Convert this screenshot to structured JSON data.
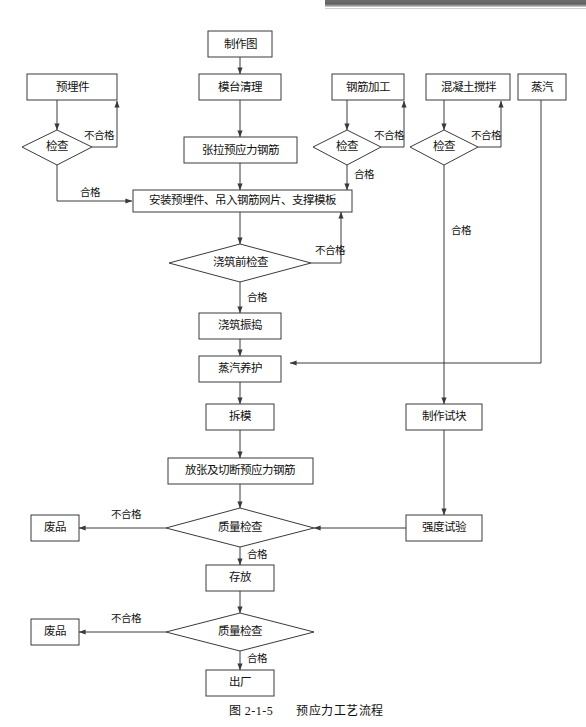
{
  "figure": {
    "caption_number": "图 2-1-5",
    "caption_title": "预应力工艺流程"
  },
  "labels": {
    "pass": "合格",
    "fail": "不合格",
    "inspect": "检查"
  },
  "nodes": {
    "drawing": "制作图",
    "platform_cleaning": "模台清理",
    "tension_prestress_bars": "张拉预应力钢筋",
    "embedded_parts": "预埋件",
    "embedded_inspect": "检查",
    "rebar_processing": "钢筋加工",
    "rebar_inspect": "检查",
    "concrete_mixing": "混凝土搅拌",
    "concrete_inspect": "检查",
    "steam": "蒸汽",
    "install_assembly": "安装预埋件、吊入钢筋网片、支撑模板",
    "pre_pour_inspect": "浇筑前检查",
    "pour_vibrate": "浇筑振捣",
    "steam_curing": "蒸汽养护",
    "demould": "拆模",
    "release_cut_bars": "放张及切断预应力钢筋",
    "make_test_block": "制作试块",
    "strength_test": "强度试验",
    "quality_inspect_1": "质量检查",
    "quality_inspect_2": "质量检查",
    "scrap_1": "废品",
    "scrap_2": "废品",
    "storage": "存放",
    "factory_out": "出厂"
  },
  "edge_labels": {
    "embedded_fail": "不合格",
    "embedded_pass": "合格",
    "rebar_fail": "不合格",
    "rebar_pass": "合格",
    "concrete_fail": "不合格",
    "concrete_pass": "合格",
    "pre_pour_fail": "不合格",
    "pre_pour_pass": "合格",
    "quality1_fail": "不合格",
    "quality1_pass": "合格",
    "quality2_fail": "不合格",
    "quality2_pass": "合格"
  },
  "colors": {
    "stroke": "#3a3a3a",
    "text": "#111111",
    "background": "#ffffff",
    "scan_bar": "#616161"
  }
}
